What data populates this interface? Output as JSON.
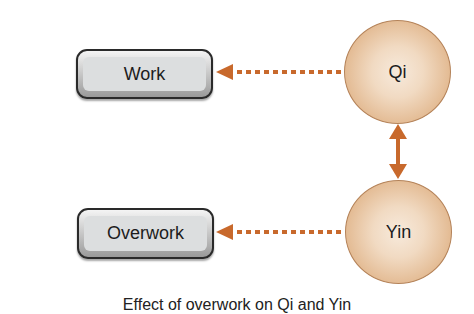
{
  "diagram": {
    "nodes": {
      "work": {
        "label": "Work"
      },
      "overwork": {
        "label": "Overwork"
      },
      "qi": {
        "label": "Qi"
      },
      "yin": {
        "label": "Yin"
      }
    },
    "edges": [
      {
        "from": "qi",
        "to": "work",
        "style": "dotted",
        "arrow": "single"
      },
      {
        "from": "yin",
        "to": "overwork",
        "style": "dotted",
        "arrow": "single"
      },
      {
        "from": "qi",
        "to": "yin",
        "style": "solid",
        "arrow": "double"
      }
    ],
    "colors": {
      "arrow": "#c8692c",
      "circle_fill": "#e8c4a0",
      "circle_border": "#b48258",
      "box_fill": "#dcdedf",
      "box_border": "#2a2a2a"
    },
    "caption": "Effect of overwork on Qi and Yin"
  }
}
